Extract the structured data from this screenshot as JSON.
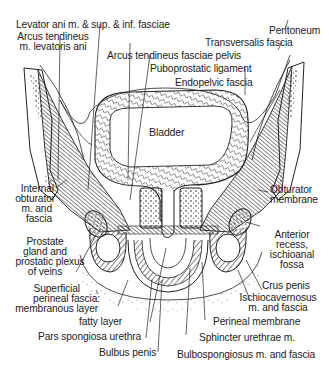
{
  "figure": {
    "center_label": "Bladder",
    "labels": {
      "levator_ani": "Levator ani m. & sup. & inf. fasciae",
      "arcus_levatoris_1": "Arcus tendineus",
      "arcus_levatoris_2": "m. levatoris ani",
      "arcus_fasciae_pelvis": "Arcus tendineus fasciae pelvis",
      "puboprostatic": "Puboprostatic ligament",
      "endopelvic": "Endopelvic fascia",
      "peritoneum": "Peritoneum",
      "transversalis": "Transversalis fascia",
      "internal_obturator_1": "Internal",
      "internal_obturator_2": "obturator",
      "internal_obturator_3": "m. and",
      "internal_obturator_4": "fascia",
      "prostate_1": "Prostate",
      "prostate_2": "gland and",
      "prostate_3": "prostatic plexus",
      "prostate_4": "of veins",
      "obturator_membrane_1": "Obturator",
      "obturator_membrane_2": "membrane",
      "anterior_recess_1": "Anterior",
      "anterior_recess_2": "recess,",
      "anterior_recess_3": "ischioanal",
      "anterior_recess_4": "fossa",
      "crus_penis": "Crus penis",
      "ischiocavernosus_1": "Ischiocavernosus",
      "ischiocavernosus_2": "m. and fascia",
      "perineal_membrane": "Perineal membrane",
      "sphincter": "Sphincter urethrae m.",
      "bulbospongiosus": "Bulbospongiosus m. and fascia",
      "superficial_1": "Superficial",
      "superficial_2": "perineal fascia:",
      "superficial_3": "membranous layer",
      "fatty_layer": "fatty layer",
      "pars_spongiosa": "Pars spongiosa urethra",
      "bulbus_penis": "Bulbus penis"
    }
  },
  "colors": {
    "ink": "#222222",
    "paper": "#ffffff",
    "hatch": "#555555"
  }
}
